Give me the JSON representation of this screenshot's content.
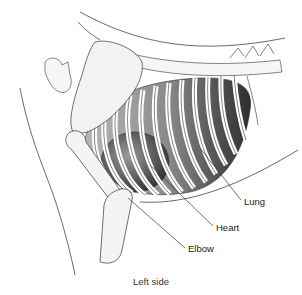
{
  "figure": {
    "labels": [
      {
        "id": "lung",
        "text": "Lung",
        "x": 244,
        "y": 196,
        "line": [
          200,
          148,
          241,
          200
        ]
      },
      {
        "id": "heart",
        "text": "Heart",
        "x": 216,
        "y": 222,
        "line": [
          150,
          165,
          213,
          226
        ]
      },
      {
        "id": "elbow",
        "text": "Elbow",
        "x": 188,
        "y": 243,
        "line": [
          128,
          198,
          185,
          248
        ]
      }
    ],
    "caption": "Left side",
    "colors": {
      "ink": "#333333",
      "bone": "#f4f4f4",
      "lung": "#8c8c8c",
      "lung_dark": "#3a3a3a",
      "heart": "#555555"
    }
  }
}
